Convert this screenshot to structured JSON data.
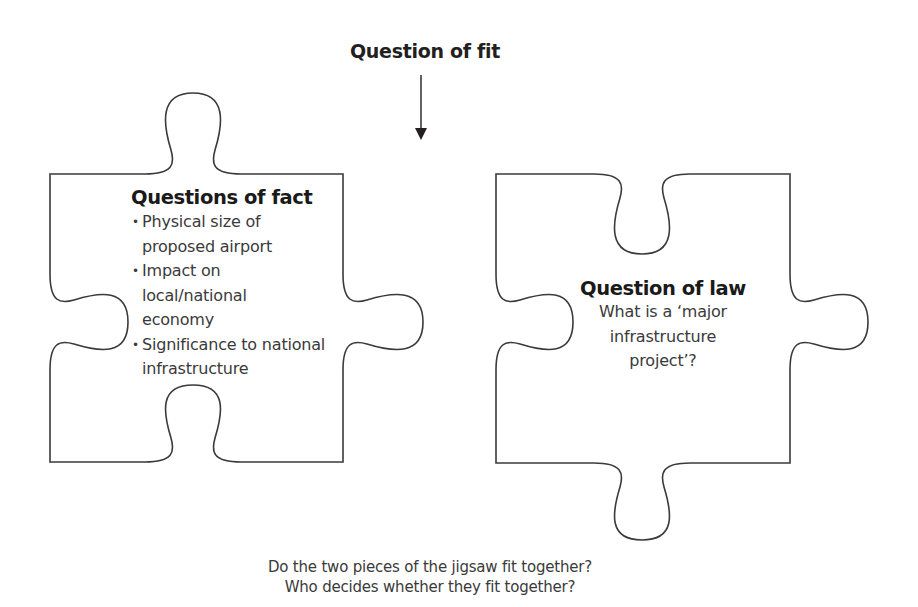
{
  "diagram": {
    "title": "Question of fit",
    "arrow": {
      "direction": "down",
      "icon": "arrow-down-icon"
    },
    "left_piece": {
      "heading": "Questions of fact",
      "bullets": [
        "Physical size of proposed airport",
        "Impact on local/national economy",
        "Significance to national infrastructure"
      ],
      "bullet_glyph": "•"
    },
    "right_piece": {
      "heading": "Question of law",
      "text": "What is a ‘major infrastructure project’?"
    },
    "caption": {
      "line1": "Do the two pieces of the jigsaw fit together?",
      "line2": "Who decides whether they fit together?"
    },
    "colors": {
      "background": "#ffffff",
      "stroke": "#3a3a3a",
      "text": "#231f20"
    }
  }
}
